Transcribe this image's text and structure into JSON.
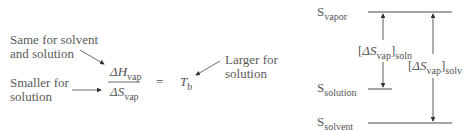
{
  "left_panel": {
    "annotations": {
      "same": [
        "Same for solvent",
        "and solution"
      ],
      "smaller": [
        "Smaller for",
        "solution"
      ],
      "larger": [
        "Larger for",
        "solution"
      ]
    },
    "equation": {
      "numerator_symbol": "ΔH",
      "numerator_sub": "vap",
      "denominator_symbol": "ΔS",
      "denominator_sub": "vap",
      "equals": "=",
      "result_symbol": "T",
      "result_sub": "b"
    }
  },
  "right_panel": {
    "levels": {
      "vapor": {
        "symbol": "S",
        "sub": "vapor"
      },
      "solution": {
        "symbol": "S",
        "sub": "solution"
      },
      "solvent": {
        "symbol": "S",
        "sub": "solvent"
      }
    },
    "intervals": {
      "soln": {
        "open": "[",
        "symbol": "ΔS",
        "sub": "vap",
        "close": "]",
        "outer_sub": "soln"
      },
      "solv": {
        "open": "[",
        "symbol": "ΔS",
        "sub": "vap",
        "close": "]",
        "outer_sub": "solv"
      }
    }
  },
  "colors": {
    "text": "#555555",
    "line": "#333333"
  }
}
